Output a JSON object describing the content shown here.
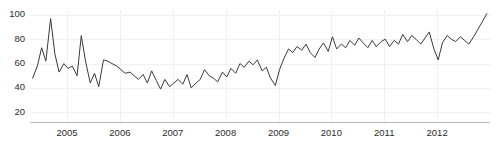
{
  "chart_data": {
    "type": "line",
    "title": "",
    "subtitle": "",
    "xlabel": "",
    "ylabel": "",
    "grid": true,
    "legend": false,
    "legend_position": "none",
    "line_color": "#3a3a3a",
    "background_color": "#ffffff",
    "gridline_color": "#f0f0f0",
    "axis_color": "#b9b9b9",
    "xlim": [
      2004.3,
      2013.0
    ],
    "ylim": [
      12,
      104
    ],
    "yticks": [
      20,
      40,
      60,
      80,
      100
    ],
    "ytick_labels": [
      "20",
      "40",
      "60",
      "80",
      "100"
    ],
    "xticks": [
      2005,
      2006,
      2007,
      2008,
      2009,
      2010,
      2011,
      2012
    ],
    "xtick_labels": [
      "2005",
      "2006",
      "2007",
      "2008",
      "2009",
      "2010",
      "2011",
      "2012"
    ],
    "series": [
      {
        "name": "series-1",
        "x": [
          2004.35,
          2004.44,
          2004.52,
          2004.6,
          2004.69,
          2004.77,
          2004.85,
          2004.94,
          2005.02,
          2005.1,
          2005.19,
          2005.27,
          2005.35,
          2005.44,
          2005.52,
          2005.6,
          2005.69,
          2005.77,
          2005.85,
          2005.94,
          2006.02,
          2006.1,
          2006.19,
          2006.27,
          2006.35,
          2006.44,
          2006.52,
          2006.6,
          2006.69,
          2006.77,
          2006.85,
          2006.94,
          2007.02,
          2007.1,
          2007.19,
          2007.27,
          2007.35,
          2007.44,
          2007.52,
          2007.6,
          2007.69,
          2007.77,
          2007.85,
          2007.94,
          2008.02,
          2008.1,
          2008.19,
          2008.27,
          2008.35,
          2008.44,
          2008.52,
          2008.6,
          2008.69,
          2008.77,
          2008.85,
          2008.94,
          2009.02,
          2009.1,
          2009.19,
          2009.27,
          2009.35,
          2009.44,
          2009.52,
          2009.6,
          2009.69,
          2009.77,
          2009.85,
          2009.94,
          2010.02,
          2010.1,
          2010.19,
          2010.27,
          2010.35,
          2010.44,
          2010.52,
          2010.6,
          2010.69,
          2010.77,
          2010.85,
          2010.94,
          2011.02,
          2011.1,
          2011.19,
          2011.27,
          2011.35,
          2011.44,
          2011.52,
          2011.6,
          2011.69,
          2011.77,
          2011.85,
          2011.94,
          2012.02,
          2012.1,
          2012.19,
          2012.27,
          2012.35,
          2012.44,
          2012.52,
          2012.6,
          2012.69,
          2012.77,
          2012.85,
          2012.94
        ],
        "values": [
          48,
          58,
          73,
          62,
          97,
          68,
          53,
          60,
          56,
          58,
          50,
          83,
          62,
          44,
          52,
          41,
          63,
          62,
          60,
          58,
          55,
          52,
          53,
          50,
          47,
          51,
          44,
          54,
          46,
          39,
          47,
          41,
          44,
          47,
          43,
          51,
          40,
          44,
          47,
          55,
          50,
          48,
          45,
          53,
          49,
          56,
          52,
          60,
          57,
          62,
          59,
          63,
          54,
          57,
          48,
          42,
          55,
          64,
          72,
          69,
          74,
          71,
          76,
          69,
          65,
          72,
          77,
          70,
          82,
          72,
          76,
          73,
          79,
          75,
          81,
          77,
          73,
          79,
          74,
          78,
          80,
          74,
          79,
          76,
          84,
          78,
          83,
          80,
          76,
          81,
          86,
          72,
          63,
          77,
          83,
          80,
          78,
          82,
          79,
          76,
          82,
          88,
          94,
          101
        ]
      }
    ]
  }
}
